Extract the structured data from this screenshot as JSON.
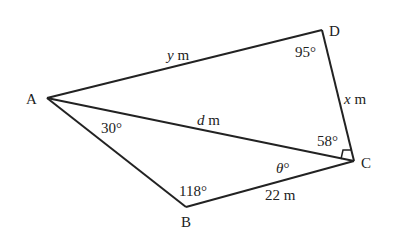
{
  "diagram": {
    "type": "quadrilateral-with-diagonal",
    "vertices": {
      "A": "A",
      "B": "B",
      "C": "C",
      "D": "D"
    },
    "sides": {
      "AD": {
        "var": "y",
        "unit": " m"
      },
      "DC": {
        "var": "x",
        "unit": " m"
      },
      "AC": {
        "var": "d",
        "unit": " m"
      },
      "BC": {
        "value": "22 m"
      }
    },
    "angles": {
      "D": "95°",
      "DCA": "58°",
      "BAC": "30°",
      "B": "118°",
      "BCA": {
        "var": "θ",
        "unit": "°"
      },
      "C_right_angle_marker": true
    }
  }
}
